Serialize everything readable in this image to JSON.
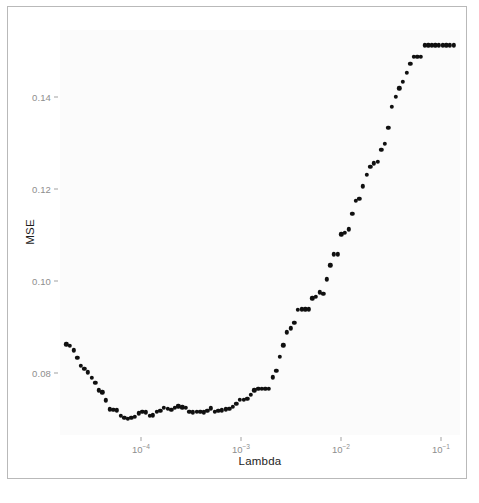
{
  "figure": {
    "frame_border_color": "#b9b9b9",
    "panel_background": "#fbfbfb",
    "point_color": "#101010",
    "axis_text_color": "#8e8e8e",
    "title_text_color": "#1d1d1d"
  },
  "axes": {
    "y_title": "MSE",
    "x_title": "Lambda",
    "y_tick_labels": [
      "0.08",
      "0.10",
      "0.12",
      "0.14"
    ],
    "y_tick_values": [
      0.08,
      0.1,
      0.12,
      0.14
    ],
    "x_tick_labels": [
      "10-4",
      "10-3",
      "10-2",
      "10-1"
    ],
    "x_tick_bases": [
      "10",
      "10",
      "10",
      "10"
    ],
    "x_tick_exponents": [
      "−4",
      "−3",
      "−2",
      "−1"
    ],
    "x_tick_values": [
      -4,
      -3,
      -2,
      -1
    ]
  },
  "chart_data": {
    "type": "scatter",
    "title": "",
    "subtitle": "",
    "xlabel": "Lambda",
    "ylabel": "MSE",
    "xscale": "log",
    "yscale": "linear",
    "xlim": [
      1.55e-05,
      0.155
    ],
    "ylim": [
      0.0665,
      0.1545
    ],
    "grid": false,
    "legend": "none",
    "annotations": [],
    "series": [
      {
        "name": "Cross-validated MSE",
        "x": [
          1.8e-05,
          1.95e-05,
          2.12e-05,
          2.3e-05,
          2.5e-05,
          2.72e-05,
          2.95e-05,
          3.21e-05,
          3.49e-05,
          3.79e-05,
          4.12e-05,
          4.48e-05,
          4.87e-05,
          5.29e-05,
          5.75e-05,
          6.25e-05,
          6.79e-05,
          7.38e-05,
          8.03e-05,
          8.72e-05,
          9.48e-05,
          0.000103,
          0.000112,
          0.000122,
          0.000132,
          0.000144,
          0.000156,
          0.00017,
          0.000185,
          0.000201,
          0.000218,
          0.000237,
          0.000258,
          0.00028,
          0.000305,
          0.000331,
          0.00036,
          0.000391,
          0.000425,
          0.000462,
          0.000502,
          0.000546,
          0.000593,
          0.000645,
          0.000701,
          0.000762,
          0.000828,
          0.0009,
          0.000978,
          0.001063,
          0.001155,
          0.001256,
          0.001365,
          0.001484,
          0.001613,
          0.001753,
          0.001905,
          0.002071,
          0.002251,
          0.002446,
          0.002659,
          0.00289,
          0.003141,
          0.003414,
          0.003711,
          0.004033,
          0.004384,
          0.004765,
          0.005179,
          0.005629,
          0.006118,
          0.00665,
          0.007228,
          0.007856,
          0.008539,
          0.009281,
          0.010088,
          0.010965,
          0.011918,
          0.012954,
          0.01408,
          0.015304,
          0.016634,
          0.01808,
          0.019652,
          0.02136,
          0.023217,
          0.025235,
          0.027428,
          0.029812,
          0.032404,
          0.03522,
          0.038281,
          0.041609,
          0.045226,
          0.049158,
          0.053431,
          0.058075,
          0.063123,
          0.06861,
          0.074573,
          0.081055,
          0.088101,
          0.095759,
          0.104082,
          0.11313,
          0.122963,
          0.133651
        ],
        "y": [
          0.0862,
          0.0859,
          0.0849,
          0.0833,
          0.0815,
          0.0809,
          0.0801,
          0.0789,
          0.0779,
          0.0762,
          0.0758,
          0.074,
          0.0721,
          0.072,
          0.0719,
          0.0707,
          0.0702,
          0.07,
          0.0702,
          0.0705,
          0.0712,
          0.0716,
          0.0714,
          0.0707,
          0.0708,
          0.0715,
          0.0718,
          0.0724,
          0.0722,
          0.072,
          0.0724,
          0.0727,
          0.0725,
          0.0724,
          0.0715,
          0.0714,
          0.0716,
          0.0715,
          0.0714,
          0.0718,
          0.0723,
          0.0716,
          0.0717,
          0.0719,
          0.0721,
          0.0722,
          0.0726,
          0.0733,
          0.0742,
          0.0742,
          0.0743,
          0.0752,
          0.0762,
          0.0765,
          0.0766,
          0.0766,
          0.0766,
          0.079,
          0.0804,
          0.0835,
          0.086,
          0.0888,
          0.0897,
          0.0909,
          0.0937,
          0.0938,
          0.0938,
          0.0938,
          0.0962,
          0.0965,
          0.0975,
          0.0972,
          0.1003,
          0.1034,
          0.1058,
          0.1058,
          0.1101,
          0.1105,
          0.1112,
          0.1146,
          0.1174,
          0.1178,
          0.1205,
          0.123,
          0.1248,
          0.1255,
          0.1259,
          0.1285,
          0.1298,
          0.1332,
          0.1378,
          0.14,
          0.1418,
          0.1432,
          0.1452,
          0.1472,
          0.1487,
          0.1487,
          0.1487,
          0.1512,
          0.1512,
          0.1512,
          0.1512,
          0.1512,
          0.1512,
          0.1512,
          0.1512,
          0.1512
        ]
      }
    ]
  }
}
